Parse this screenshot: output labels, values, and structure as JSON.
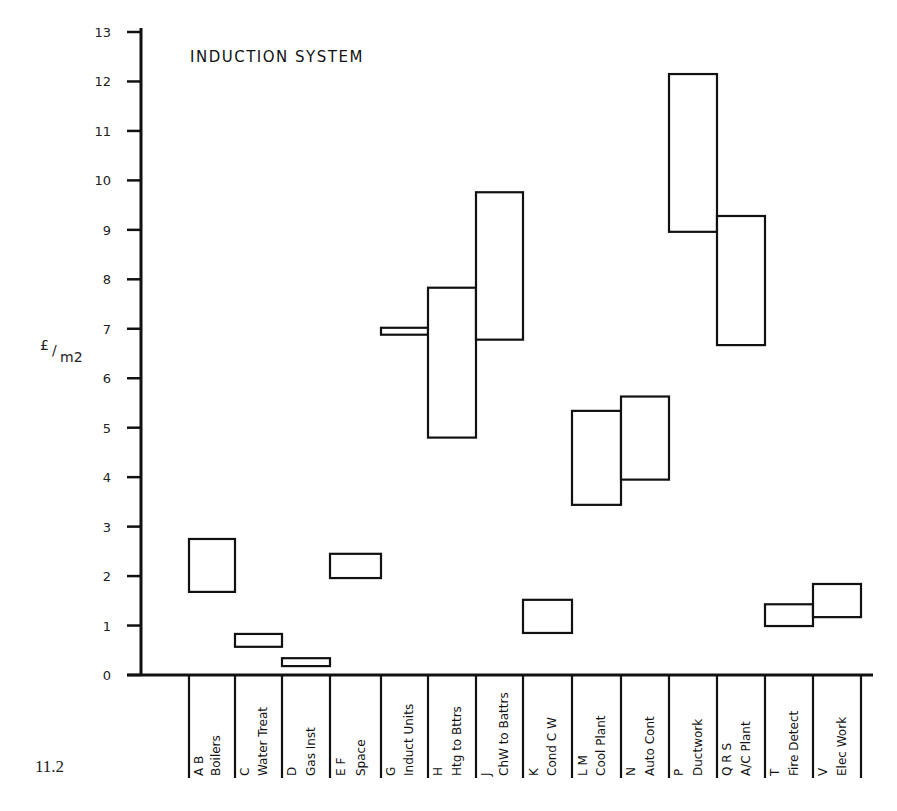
{
  "figure_number": "11.2",
  "chart_data": {
    "type": "floating-bar",
    "title": "INDUCTION SYSTEM",
    "xlabel": "",
    "ylabel": "£/m2",
    "ylim": [
      0,
      13
    ],
    "yticks": [
      0,
      1,
      2,
      3,
      4,
      5,
      6,
      7,
      8,
      9,
      10,
      11,
      12,
      13
    ],
    "grid": false,
    "legend": null,
    "categories": [
      {
        "code": "A B",
        "name": "Boilers"
      },
      {
        "code": "C",
        "name": "Water Treat"
      },
      {
        "code": "D",
        "name": "Gas Inst"
      },
      {
        "code": "E F",
        "name": "Space"
      },
      {
        "code": "G",
        "name": "Induct Units"
      },
      {
        "code": "H",
        "name": "Htg to Bttrs"
      },
      {
        "code": "J",
        "name": "ChW to Battrs"
      },
      {
        "code": "K",
        "name": "Cond C W"
      },
      {
        "code": "L M",
        "name": "Cool Plant"
      },
      {
        "code": "N",
        "name": "Auto Cont"
      },
      {
        "code": "P",
        "name": "Ductwork"
      },
      {
        "code": "Q R S",
        "name": "A/C Plant"
      },
      {
        "code": "T",
        "name": "Fire Detect"
      },
      {
        "code": "V",
        "name": "Elec Work"
      }
    ],
    "series": [
      {
        "name": "cost range (low-high)",
        "low": [
          1.68,
          0.57,
          0.18,
          1.96,
          6.88,
          4.8,
          6.78,
          0.85,
          3.44,
          3.95,
          8.96,
          6.67,
          0.99,
          1.17
        ],
        "high": [
          2.75,
          0.83,
          0.34,
          2.45,
          7.02,
          7.83,
          9.76,
          1.52,
          5.34,
          5.63,
          12.15,
          9.28,
          1.43,
          1.84
        ]
      }
    ]
  }
}
